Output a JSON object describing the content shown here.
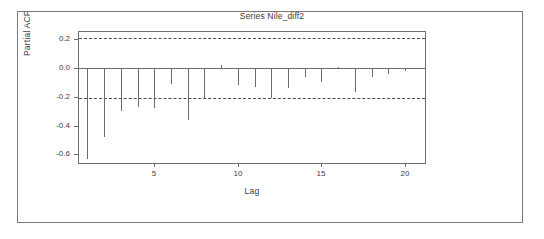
{
  "chart_data": {
    "type": "bar",
    "title": "Series Nile_diff2",
    "xlabel": "Lag",
    "ylabel": "Partial ACF",
    "grid": false,
    "legend": null,
    "xlim": [
      0.5,
      21.2
    ],
    "ylim": [
      -0.66,
      0.25
    ],
    "xticks": [
      5,
      10,
      15,
      20
    ],
    "xtick_labels": [
      "5",
      "10",
      "15",
      "20"
    ],
    "yticks": [
      0.2,
      0.0,
      -0.2,
      -0.4,
      -0.6
    ],
    "ytick_labels": [
      "0.2",
      "0.0",
      "-0.2",
      "-0.4",
      "-0.6"
    ],
    "zero_line": 0.0,
    "confidence_bands": {
      "upper": 0.205,
      "lower": -0.205,
      "style": "dashed",
      "color": "#4a4a4a"
    },
    "bar_color": "#6b6b6b",
    "categories": [
      1,
      2,
      3,
      4,
      5,
      6,
      7,
      8,
      9,
      10,
      11,
      12,
      13,
      14,
      15,
      16,
      17,
      18,
      19,
      20,
      21
    ],
    "values": [
      -0.63,
      -0.48,
      -0.3,
      -0.27,
      -0.28,
      -0.11,
      -0.36,
      -0.21,
      0.02,
      -0.12,
      -0.13,
      -0.21,
      -0.14,
      -0.06,
      -0.1,
      0.01,
      -0.17,
      -0.06,
      -0.04,
      -0.02,
      -0.01
    ],
    "series": [
      {
        "name": "Partial ACF",
        "values": [
          -0.63,
          -0.48,
          -0.3,
          -0.27,
          -0.28,
          -0.11,
          -0.36,
          -0.21,
          0.02,
          -0.12,
          -0.13,
          -0.21,
          -0.14,
          -0.06,
          -0.1,
          0.01,
          -0.17,
          -0.06,
          -0.04,
          -0.02,
          -0.01
        ]
      }
    ]
  }
}
